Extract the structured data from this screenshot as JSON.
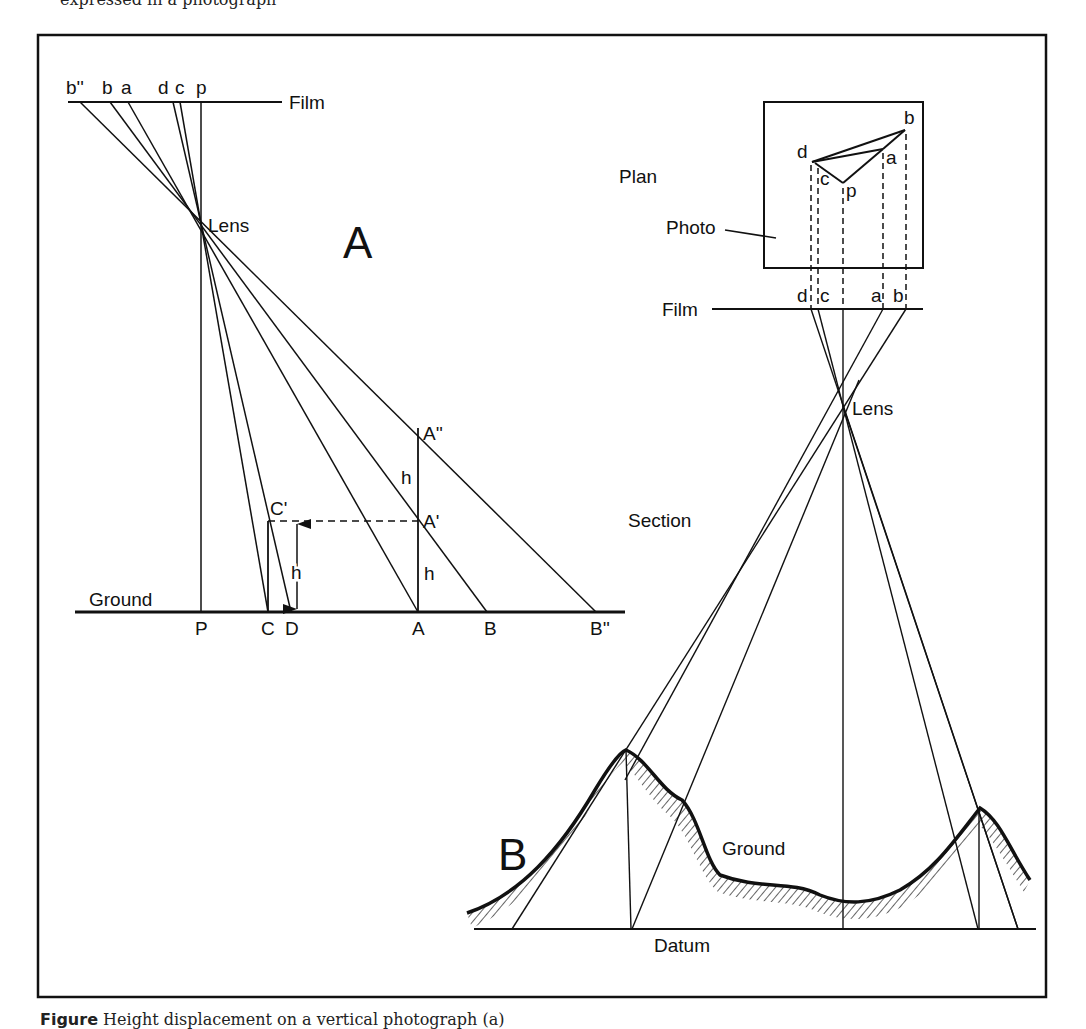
{
  "page": {
    "top_caption_fragment": "expressed in a photograph",
    "bottom_caption": {
      "figure": "Figure",
      "text": "Height displacement on a vertical photograph (a)"
    }
  },
  "diagram_a": {
    "panel_label": "A",
    "film_label": "Film",
    "lens_label": "Lens",
    "ground_label": "Ground",
    "film_points": [
      "b''",
      "b",
      "a",
      "d",
      "c",
      "p"
    ],
    "ground_points": [
      "P",
      "C",
      "D",
      "A",
      "B",
      "B''"
    ],
    "elevated_points": [
      "A''",
      "A'",
      "C'"
    ],
    "height_labels": [
      "h",
      "h",
      "h"
    ]
  },
  "diagram_b": {
    "panel_label": "B",
    "plan_label": "Plan",
    "photo_label": "Photo",
    "film_label": "Film",
    "lens_label": "Lens",
    "section_label": "Section",
    "ground_label": "Ground",
    "datum_label": "Datum",
    "plan_points": [
      "b",
      "a",
      "d",
      "c",
      "p"
    ],
    "film_points": [
      "d",
      "c",
      "a",
      "b"
    ]
  },
  "colors": {
    "ink": "#111111",
    "paper": "#ffffff"
  }
}
